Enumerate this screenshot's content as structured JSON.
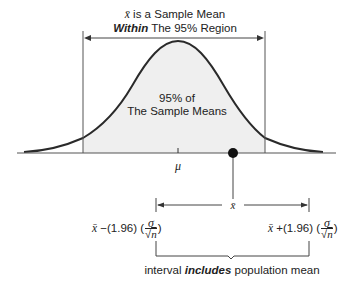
{
  "title": {
    "line1_symbol": "x̄",
    "line1_text": " is a Sample Mean",
    "line2_bold": "Within",
    "line2_text": " The 95% Region"
  },
  "curve_label": {
    "line1": "95% of",
    "line2": "The Sample Means"
  },
  "axis": {
    "mean_label": "μ",
    "sample_mean_label": "x̄"
  },
  "interval": {
    "lower": {
      "symbol": "x̄",
      "op": " −(1.96) (",
      "num": "σ",
      "den_root": "√",
      "den_var": "n",
      "close": ")"
    },
    "upper": {
      "symbol": "x̄",
      "op": " +(1.96) (",
      "num": "σ",
      "den_root": "√",
      "den_var": "n",
      "close": ")"
    },
    "caption_pre": "interval ",
    "caption_bold": "includes",
    "caption_post": " population mean"
  },
  "colors": {
    "line": "#2a2a2a",
    "shade": "#efefef",
    "dot": "#111111"
  }
}
